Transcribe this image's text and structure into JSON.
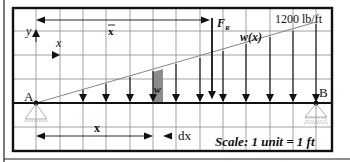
{
  "diagram": {
    "type": "distributed-load-beam",
    "labels": {
      "load_intensity": "1200 lb/ft",
      "load_function": "w(x)",
      "resultant_force": "F",
      "resultant_subscript": "R",
      "centroid_distance": "x",
      "y_axis": "y",
      "x_axis": "x",
      "element_label": "w",
      "support_a": "A",
      "support_b": "B",
      "position": "x",
      "differential": "dx",
      "scale": "Scale: 1 unit = 1 ft"
    },
    "colors": {
      "grid": "#8a8a8a",
      "border": "#111111",
      "beam": "#111111",
      "element_fill": "#8c8c8c",
      "load_line": "#777777"
    },
    "grid": {
      "columns": 13,
      "unit": "1 ft"
    }
  }
}
